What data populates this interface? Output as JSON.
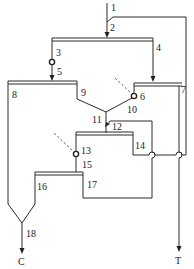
{
  "diagram": {
    "type": "flotation flowsheet",
    "stream_labels": {
      "n1": "1",
      "n2": "2",
      "n3": "3",
      "n4": "4",
      "n5": "5",
      "n6": "6",
      "n7": "7",
      "n8": "8",
      "n9": "9",
      "n10": "10",
      "n11": "11",
      "n12": "12",
      "n13": "13",
      "n14": "14",
      "n15": "15",
      "n16": "16",
      "n17": "17",
      "n18": "18"
    },
    "outputs": {
      "concentrate": "C",
      "tailings": "T"
    },
    "colors": {
      "line": "#2a2a2a",
      "background": "#ffffff"
    }
  }
}
